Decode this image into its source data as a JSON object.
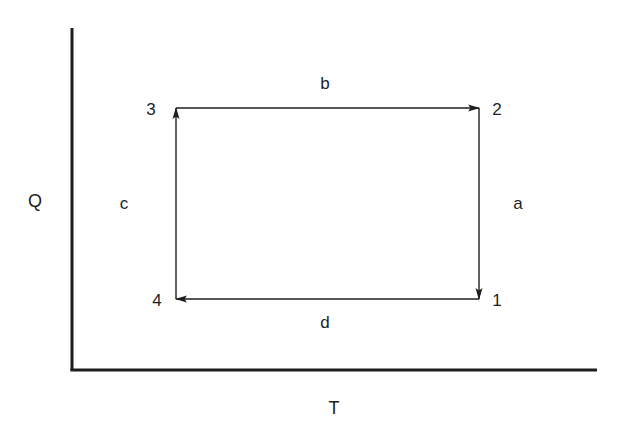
{
  "diagram": {
    "type": "cycle-diagram",
    "axes": {
      "x_label": "T",
      "y_label": "Q"
    },
    "nodes": [
      {
        "id": "1",
        "label": "1",
        "position": "bottom-right"
      },
      {
        "id": "2",
        "label": "2",
        "position": "top-right"
      },
      {
        "id": "3",
        "label": "3",
        "position": "top-left"
      },
      {
        "id": "4",
        "label": "4",
        "position": "bottom-left"
      }
    ],
    "edges": [
      {
        "label": "a",
        "from": "2",
        "to": "1",
        "direction": "down"
      },
      {
        "label": "b",
        "from": "3",
        "to": "2",
        "direction": "right"
      },
      {
        "label": "c",
        "from": "4",
        "to": "3",
        "direction": "up"
      },
      {
        "label": "d",
        "from": "1",
        "to": "4",
        "direction": "left"
      }
    ],
    "colors": {
      "line": "#1e1e1e",
      "background": "#ffffff"
    }
  }
}
